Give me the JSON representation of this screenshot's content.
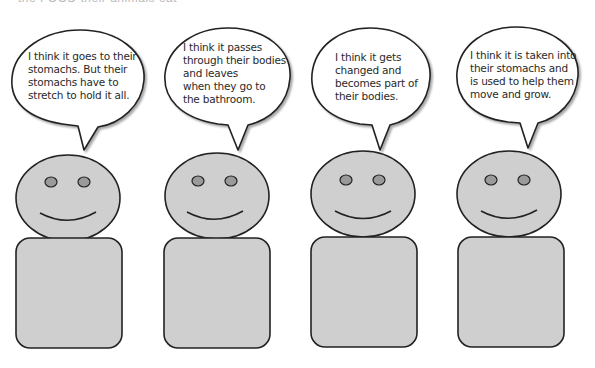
{
  "header": {
    "cropped_title": "the FOOD their animals eat"
  },
  "colors": {
    "figure_fill": "#cfcfcf",
    "eye_fill": "#9a9a9a",
    "outline": "#222222",
    "bubble_fill": "#ffffff",
    "text": "#2a2a2a"
  },
  "characters": [
    {
      "id": 1,
      "speech": {
        "lines": [
          "I think it goes to their",
          "stomachs. But their",
          "stomachs have to",
          "stretch to hold it all."
        ]
      }
    },
    {
      "id": 2,
      "speech": {
        "lines": [
          "I think it passes",
          "through their bodies",
          "and leaves",
          "when they go to",
          "the bathroom."
        ]
      }
    },
    {
      "id": 3,
      "speech": {
        "lines": [
          "I think it gets",
          "changed and",
          "becomes part of",
          "their bodies."
        ]
      }
    },
    {
      "id": 4,
      "speech": {
        "lines": [
          "I think it is taken into",
          "their stomachs and",
          "is used to help them",
          "move and grow."
        ]
      }
    }
  ]
}
